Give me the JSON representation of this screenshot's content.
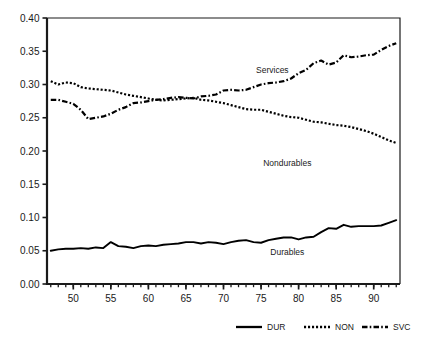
{
  "chart_data": {
    "type": "line",
    "title": "",
    "subtitle": "",
    "xlabel": "",
    "ylabel": "",
    "xlim": [
      46.5,
      93.5
    ],
    "ylim": [
      0.0,
      0.4
    ],
    "grid": false,
    "legend_position": "bottom",
    "x_tick_labels": [
      "50",
      "55",
      "60",
      "65",
      "70",
      "75",
      "80",
      "85",
      "90"
    ],
    "x_tick_values": [
      50,
      55,
      60,
      65,
      70,
      75,
      80,
      85,
      90
    ],
    "x_minor_tick_step": 1,
    "y_tick_labels": [
      "0.00",
      "0.05",
      "0.10",
      "0.15",
      "0.20",
      "0.25",
      "0.30",
      "0.35",
      "0.40"
    ],
    "y_tick_values": [
      0.0,
      0.05,
      0.1,
      0.15,
      0.2,
      0.25,
      0.3,
      0.35,
      0.4
    ],
    "annotations": [
      {
        "text": "Services",
        "x": 76.5,
        "y": 0.318
      },
      {
        "text": "Nondurables",
        "x": 78.5,
        "y": 0.178
      },
      {
        "text": "Durables",
        "x": 78.5,
        "y": 0.043
      }
    ],
    "x": [
      47,
      48,
      49,
      50,
      51,
      52,
      53,
      54,
      55,
      56,
      57,
      58,
      59,
      60,
      61,
      62,
      63,
      64,
      65,
      66,
      67,
      68,
      69,
      70,
      71,
      72,
      73,
      74,
      75,
      76,
      77,
      78,
      79,
      80,
      81,
      82,
      83,
      84,
      85,
      86,
      87,
      88,
      89,
      90,
      91,
      92,
      93
    ],
    "series": [
      {
        "name": "DUR",
        "label": "Durables",
        "linestyle": "solid",
        "color": "#000000",
        "values": [
          0.05,
          0.052,
          0.053,
          0.053,
          0.054,
          0.053,
          0.055,
          0.054,
          0.063,
          0.057,
          0.056,
          0.054,
          0.057,
          0.058,
          0.057,
          0.059,
          0.06,
          0.061,
          0.063,
          0.063,
          0.061,
          0.063,
          0.062,
          0.06,
          0.063,
          0.065,
          0.066,
          0.063,
          0.062,
          0.066,
          0.068,
          0.07,
          0.07,
          0.067,
          0.07,
          0.071,
          0.078,
          0.084,
          0.083,
          0.089,
          0.086,
          0.087,
          0.087,
          0.087,
          0.088,
          0.092,
          0.096
        ]
      },
      {
        "name": "NON",
        "label": "Nondurables",
        "linestyle": "dotted",
        "color": "#000000",
        "values": [
          0.305,
          0.3,
          0.303,
          0.302,
          0.296,
          0.294,
          0.293,
          0.292,
          0.291,
          0.288,
          0.285,
          0.283,
          0.281,
          0.279,
          0.277,
          0.276,
          0.277,
          0.278,
          0.279,
          0.28,
          0.277,
          0.276,
          0.274,
          0.272,
          0.269,
          0.266,
          0.263,
          0.262,
          0.262,
          0.259,
          0.256,
          0.253,
          0.251,
          0.25,
          0.247,
          0.244,
          0.243,
          0.241,
          0.239,
          0.238,
          0.236,
          0.233,
          0.23,
          0.226,
          0.221,
          0.216,
          0.212
        ]
      },
      {
        "name": "SVC",
        "label": "Services",
        "linestyle": "dashdot",
        "color": "#000000",
        "values": [
          0.277,
          0.277,
          0.274,
          0.271,
          0.262,
          0.248,
          0.25,
          0.252,
          0.256,
          0.262,
          0.266,
          0.272,
          0.273,
          0.275,
          0.277,
          0.278,
          0.28,
          0.281,
          0.28,
          0.279,
          0.282,
          0.283,
          0.285,
          0.291,
          0.292,
          0.291,
          0.292,
          0.296,
          0.3,
          0.302,
          0.303,
          0.305,
          0.309,
          0.317,
          0.322,
          0.332,
          0.336,
          0.33,
          0.333,
          0.344,
          0.341,
          0.342,
          0.344,
          0.345,
          0.352,
          0.358,
          0.362
        ]
      }
    ]
  },
  "legend": {
    "items": [
      {
        "key": "DUR",
        "label": "DUR",
        "style": "solid"
      },
      {
        "key": "NON",
        "label": "NON",
        "style": "dotted"
      },
      {
        "key": "SVC",
        "label": "SVC",
        "style": "dashdot"
      }
    ]
  },
  "colors": {
    "axis": "#1a1a1a",
    "line": "#000000",
    "background": "#ffffff"
  }
}
